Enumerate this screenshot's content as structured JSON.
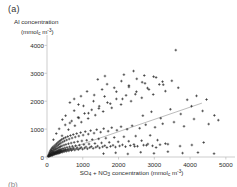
{
  "figure": {
    "panel_label": "(a)",
    "next_panel_label": "(b)",
    "background": "#ffffff",
    "marker_color": "#1a1a1a",
    "axis_color": "#b8b8b8",
    "trend_color": "#8f8f8f"
  },
  "axes": {
    "y_title_line1": "Al concentration",
    "y_title_line2_pre": "(mmol",
    "y_title_line2_sub": "c",
    "y_title_line2_mid": " m",
    "y_title_line2_sup": "-3",
    "y_title_line2_post": ")",
    "x_title_pre": "SO",
    "x_title_sub1": "4",
    "x_title_mid1": " + NO",
    "x_title_sub2": "3",
    "x_title_mid2": " concentration (mmol",
    "x_title_sub3": "c",
    "x_title_mid3": " m",
    "x_title_sup": "-3",
    "x_title_post": ")"
  },
  "chart_data": {
    "type": "scatter",
    "title": "",
    "xlabel": "SO4 + NO3 concentration (mmol_c m-3)",
    "ylabel": "Al concentration (mmol_c m-3)",
    "xlim": [
      0,
      5200
    ],
    "ylim": [
      0,
      4300
    ],
    "xticks": [
      0,
      1000,
      2000,
      3000,
      4000,
      5000
    ],
    "yticks": [
      0,
      1000,
      2000,
      3000,
      4000
    ],
    "xtick_labels": [
      "0",
      "1000",
      "2000",
      "3000",
      "4000",
      "5000"
    ],
    "ytick_labels": [
      "0",
      "1000",
      "2000",
      "3000",
      "4000"
    ],
    "grid": false,
    "legend": false,
    "marker": "plus",
    "marker_size": 2.6,
    "trendline": {
      "visible": true,
      "x_start": 60,
      "y_start": 55,
      "x_end": 4330,
      "y_end": 1930
    },
    "points": [
      [
        30,
        25
      ],
      [
        40,
        60
      ],
      [
        45,
        20
      ],
      [
        55,
        95
      ],
      [
        60,
        40
      ],
      [
        65,
        140
      ],
      [
        70,
        70
      ],
      [
        75,
        30
      ],
      [
        80,
        180
      ],
      [
        85,
        110
      ],
      [
        90,
        55
      ],
      [
        95,
        225
      ],
      [
        100,
        85
      ],
      [
        105,
        150
      ],
      [
        110,
        45
      ],
      [
        115,
        265
      ],
      [
        120,
        120
      ],
      [
        125,
        190
      ],
      [
        130,
        70
      ],
      [
        135,
        310
      ],
      [
        140,
        100
      ],
      [
        145,
        235
      ],
      [
        150,
        60
      ],
      [
        155,
        160
      ],
      [
        160,
        350
      ],
      [
        165,
        130
      ],
      [
        170,
        210
      ],
      [
        175,
        80
      ],
      [
        180,
        290
      ],
      [
        185,
        175
      ],
      [
        190,
        110
      ],
      [
        195,
        390
      ],
      [
        200,
        145
      ],
      [
        205,
        250
      ],
      [
        210,
        95
      ],
      [
        215,
        330
      ],
      [
        220,
        185
      ],
      [
        225,
        125
      ],
      [
        230,
        430
      ],
      [
        235,
        160
      ],
      [
        240,
        275
      ],
      [
        245,
        105
      ],
      [
        250,
        365
      ],
      [
        255,
        205
      ],
      [
        260,
        140
      ],
      [
        265,
        470
      ],
      [
        270,
        180
      ],
      [
        275,
        300
      ],
      [
        280,
        115
      ],
      [
        285,
        400
      ],
      [
        290,
        225
      ],
      [
        295,
        155
      ],
      [
        300,
        510
      ],
      [
        305,
        195
      ],
      [
        310,
        325
      ],
      [
        315,
        130
      ],
      [
        320,
        435
      ],
      [
        325,
        245
      ],
      [
        330,
        170
      ],
      [
        335,
        550
      ],
      [
        340,
        210
      ],
      [
        345,
        350
      ],
      [
        350,
        145
      ],
      [
        355,
        470
      ],
      [
        360,
        265
      ],
      [
        365,
        185
      ],
      [
        370,
        590
      ],
      [
        375,
        225
      ],
      [
        380,
        375
      ],
      [
        385,
        160
      ],
      [
        390,
        505
      ],
      [
        395,
        285
      ],
      [
        400,
        200
      ],
      [
        410,
        630
      ],
      [
        415,
        240
      ],
      [
        420,
        400
      ],
      [
        430,
        175
      ],
      [
        440,
        540
      ],
      [
        445,
        305
      ],
      [
        450,
        215
      ],
      [
        460,
        665
      ],
      [
        470,
        255
      ],
      [
        475,
        425
      ],
      [
        480,
        190
      ],
      [
        490,
        575
      ],
      [
        500,
        325
      ],
      [
        505,
        230
      ],
      [
        515,
        700
      ],
      [
        520,
        270
      ],
      [
        530,
        450
      ],
      [
        540,
        205
      ],
      [
        550,
        610
      ],
      [
        560,
        345
      ],
      [
        570,
        245
      ],
      [
        580,
        735
      ],
      [
        590,
        285
      ],
      [
        600,
        475
      ],
      [
        610,
        220
      ],
      [
        620,
        645
      ],
      [
        630,
        365
      ],
      [
        640,
        260
      ],
      [
        655,
        770
      ],
      [
        665,
        300
      ],
      [
        675,
        500
      ],
      [
        685,
        235
      ],
      [
        700,
        680
      ],
      [
        710,
        385
      ],
      [
        720,
        275
      ],
      [
        735,
        805
      ],
      [
        745,
        315
      ],
      [
        760,
        525
      ],
      [
        775,
        250
      ],
      [
        790,
        715
      ],
      [
        800,
        405
      ],
      [
        815,
        290
      ],
      [
        830,
        840
      ],
      [
        845,
        330
      ],
      [
        860,
        550
      ],
      [
        875,
        265
      ],
      [
        890,
        750
      ],
      [
        905,
        425
      ],
      [
        920,
        305
      ],
      [
        940,
        875
      ],
      [
        955,
        345
      ],
      [
        975,
        575
      ],
      [
        995,
        280
      ],
      [
        1010,
        785
      ],
      [
        1030,
        445
      ],
      [
        1050,
        320
      ],
      [
        1070,
        910
      ],
      [
        1090,
        360
      ],
      [
        1110,
        600
      ],
      [
        1130,
        295
      ],
      [
        1155,
        820
      ],
      [
        1175,
        465
      ],
      [
        1195,
        335
      ],
      [
        1220,
        945
      ],
      [
        1240,
        375
      ],
      [
        1265,
        625
      ],
      [
        1290,
        310
      ],
      [
        1315,
        855
      ],
      [
        1340,
        485
      ],
      [
        1365,
        350
      ],
      [
        1390,
        980
      ],
      [
        1415,
        390
      ],
      [
        1445,
        650
      ],
      [
        1470,
        325
      ],
      [
        1500,
        890
      ],
      [
        1525,
        505
      ],
      [
        1555,
        365
      ],
      [
        1585,
        1015
      ],
      [
        1615,
        405
      ],
      [
        1645,
        675
      ],
      [
        1675,
        340
      ],
      [
        1710,
        925
      ],
      [
        1740,
        525
      ],
      [
        1775,
        380
      ],
      [
        1810,
        1050
      ],
      [
        1845,
        420
      ],
      [
        1880,
        700
      ],
      [
        1915,
        355
      ],
      [
        1955,
        960
      ],
      [
        1990,
        545
      ],
      [
        2030,
        395
      ],
      [
        2070,
        1085
      ],
      [
        2110,
        435
      ],
      [
        2150,
        725
      ],
      [
        2195,
        370
      ],
      [
        2240,
        995
      ],
      [
        2285,
        565
      ],
      [
        2330,
        410
      ],
      [
        2380,
        1120
      ],
      [
        2430,
        450
      ],
      [
        2480,
        750
      ],
      [
        2530,
        385
      ],
      [
        2590,
        1030
      ],
      [
        2645,
        585
      ],
      [
        2700,
        425
      ],
      [
        2760,
        1155
      ],
      [
        2820,
        465
      ],
      [
        2885,
        775
      ],
      [
        2950,
        400
      ],
      [
        3020,
        1065
      ],
      [
        3090,
        605
      ],
      [
        3160,
        440
      ],
      [
        3235,
        1190
      ],
      [
        3310,
        480
      ],
      [
        180,
        620
      ],
      [
        260,
        840
      ],
      [
        340,
        1010
      ],
      [
        420,
        760
      ],
      [
        510,
        1150
      ],
      [
        600,
        980
      ],
      [
        690,
        1290
      ],
      [
        780,
        1120
      ],
      [
        870,
        1420
      ],
      [
        960,
        1250
      ],
      [
        1050,
        1560
      ],
      [
        1150,
        1380
      ],
      [
        1250,
        1690
      ],
      [
        1350,
        1500
      ],
      [
        1460,
        1820
      ],
      [
        1570,
        1630
      ],
      [
        1690,
        1950
      ],
      [
        1810,
        1760
      ],
      [
        1940,
        2080
      ],
      [
        2070,
        1880
      ],
      [
        2210,
        2210
      ],
      [
        2350,
        2000
      ],
      [
        2500,
        2340
      ],
      [
        2650,
        2120
      ],
      [
        2810,
        2470
      ],
      [
        2970,
        2240
      ],
      [
        3140,
        2600
      ],
      [
        3310,
        2360
      ],
      [
        3490,
        2730
      ],
      [
        3670,
        2480
      ],
      [
        430,
        1340
      ],
      [
        520,
        1480
      ],
      [
        640,
        1220
      ],
      [
        760,
        1660
      ],
      [
        890,
        1400
      ],
      [
        1020,
        1830
      ],
      [
        1160,
        1570
      ],
      [
        1300,
        2000
      ],
      [
        1450,
        1740
      ],
      [
        1610,
        2170
      ],
      [
        1770,
        1910
      ],
      [
        1940,
        2340
      ],
      [
        2110,
        2080
      ],
      [
        2290,
        2510
      ],
      [
        2470,
        2250
      ],
      [
        2660,
        2680
      ],
      [
        2850,
        2420
      ],
      [
        3050,
        2850
      ],
      [
        3250,
        2590
      ],
      [
        1680,
        2610
      ],
      [
        1880,
        2480
      ],
      [
        2080,
        2720
      ],
      [
        2290,
        2560
      ],
      [
        2510,
        2800
      ],
      [
        2740,
        2640
      ],
      [
        2980,
        2880
      ],
      [
        3230,
        2700
      ],
      [
        3600,
        3830
      ],
      [
        2450,
        380
      ],
      [
        2780,
        420
      ],
      [
        3050,
        340
      ],
      [
        3380,
        460
      ],
      [
        3720,
        390
      ],
      [
        4050,
        430
      ],
      [
        4380,
        520
      ],
      [
        2680,
        1480
      ],
      [
        2920,
        1620
      ],
      [
        3180,
        1390
      ],
      [
        3450,
        1710
      ],
      [
        3740,
        1540
      ],
      [
        4040,
        1820
      ],
      [
        4350,
        1650
      ],
      [
        4680,
        1490
      ],
      [
        1580,
        120
      ],
      [
        1920,
        150
      ],
      [
        2260,
        110
      ],
      [
        2620,
        170
      ],
      [
        2990,
        130
      ],
      [
        3380,
        190
      ],
      [
        3790,
        140
      ],
      [
        4220,
        160
      ],
      [
        4670,
        120
      ],
      [
        950,
        2180
      ],
      [
        1120,
        2350
      ],
      [
        1320,
        2220
      ],
      [
        1540,
        2420
      ],
      [
        640,
        1950
      ],
      [
        760,
        2080
      ],
      [
        880,
        1880
      ],
      [
        2150,
        2950
      ],
      [
        2420,
        3080
      ],
      [
        2720,
        2920
      ],
      [
        1420,
        2780
      ],
      [
        1620,
        2900
      ],
      [
        4520,
        1180
      ],
      [
        4790,
        1320
      ],
      [
        3920,
        2050
      ],
      [
        4180,
        2190
      ],
      [
        4460,
        2060
      ],
      [
        3550,
        1250
      ],
      [
        3830,
        1100
      ],
      [
        4110,
        1360
      ]
    ]
  }
}
